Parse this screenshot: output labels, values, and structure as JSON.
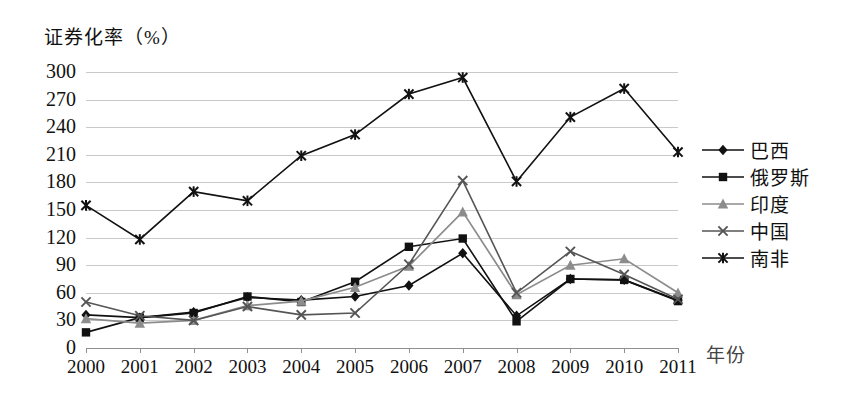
{
  "chart_data": {
    "type": "line",
    "title": "",
    "ylabel": "证券化率（%）",
    "xlabel": "年份",
    "ylim": [
      0,
      300
    ],
    "ytick_step": 30,
    "yticks": [
      "300",
      "270",
      "240",
      "210",
      "180",
      "150",
      "120",
      "90",
      "60",
      "30",
      "0"
    ],
    "grid": true,
    "legend_position": "right",
    "categories": [
      "2000",
      "2001",
      "2002",
      "2003",
      "2004",
      "2005",
      "2006",
      "2007",
      "2008",
      "2009",
      "2010",
      "2011"
    ],
    "series": [
      {
        "name": "巴西",
        "marker": "diamond",
        "color": "#111111",
        "values": [
          36,
          33,
          39,
          55,
          52,
          56,
          68,
          103,
          35,
          75,
          74,
          52
        ]
      },
      {
        "name": "俄罗斯",
        "marker": "square",
        "color": "#111111",
        "values": [
          17,
          33,
          38,
          56,
          50,
          72,
          110,
          119,
          29,
          75,
          74,
          51
        ]
      },
      {
        "name": "印度",
        "marker": "triangle",
        "color": "#8c8c8c",
        "values": [
          32,
          27,
          30,
          46,
          51,
          66,
          89,
          148,
          58,
          90,
          97,
          60
        ]
      },
      {
        "name": "中国",
        "marker": "cross",
        "color": "#555555",
        "values": [
          50,
          35,
          30,
          45,
          36,
          38,
          91,
          182,
          60,
          105,
          80,
          53
        ]
      },
      {
        "name": "南非",
        "marker": "star",
        "color": "#111111",
        "values": [
          155,
          118,
          170,
          160,
          209,
          232,
          276,
          294,
          181,
          251,
          282,
          213
        ]
      }
    ]
  },
  "legend": {
    "items": [
      {
        "label": "巴西"
      },
      {
        "label": "俄罗斯"
      },
      {
        "label": "印度"
      },
      {
        "label": "中国"
      },
      {
        "label": "南非"
      }
    ]
  }
}
